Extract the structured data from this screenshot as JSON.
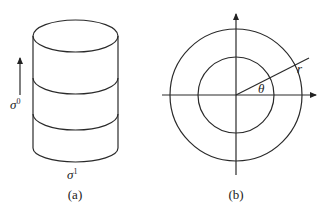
{
  "panels": [
    {
      "id": "a",
      "caption": "(a)",
      "description": "cylinder with two horizontal slices",
      "vertical_label": "σ",
      "vertical_label_sup": "0",
      "bottom_label": "σ",
      "bottom_label_sup": "1"
    },
    {
      "id": "b",
      "caption": "(b)",
      "description": "annulus (two concentric circles) with axes in polar coordinates",
      "angle_label": "θ",
      "radius_label": "r"
    }
  ]
}
